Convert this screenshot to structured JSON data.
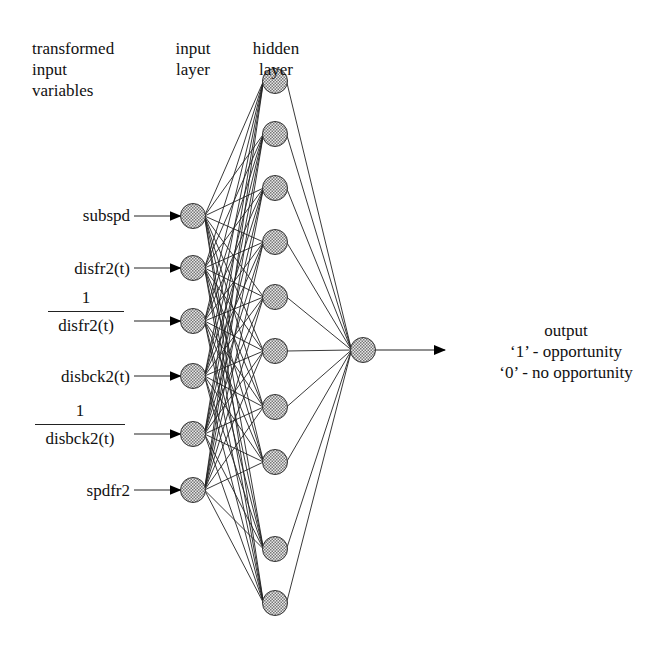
{
  "headers": {
    "transformed": [
      "transformed",
      "input",
      "variables"
    ],
    "input_layer": [
      "input",
      "layer"
    ],
    "hidden_layer": [
      "hidden",
      "layer"
    ]
  },
  "inputs": [
    {
      "label": "subspd",
      "type": "plain"
    },
    {
      "label": "disfr2(t)",
      "type": "plain"
    },
    {
      "numerator": "1",
      "denominator": "disfr2(t)",
      "type": "fraction"
    },
    {
      "label": "disbck2(t)",
      "type": "plain"
    },
    {
      "numerator": "1",
      "denominator": "disbck2(t)",
      "type": "fraction"
    },
    {
      "label": "spdfr2",
      "type": "plain"
    }
  ],
  "output": {
    "title": "output",
    "line1": "‘1’ - opportunity",
    "line2": "‘0’ - no opportunity"
  },
  "network": {
    "input_nodes": 6,
    "hidden_nodes": 10,
    "output_nodes": 1,
    "node_fill": "#b8b8b8"
  }
}
